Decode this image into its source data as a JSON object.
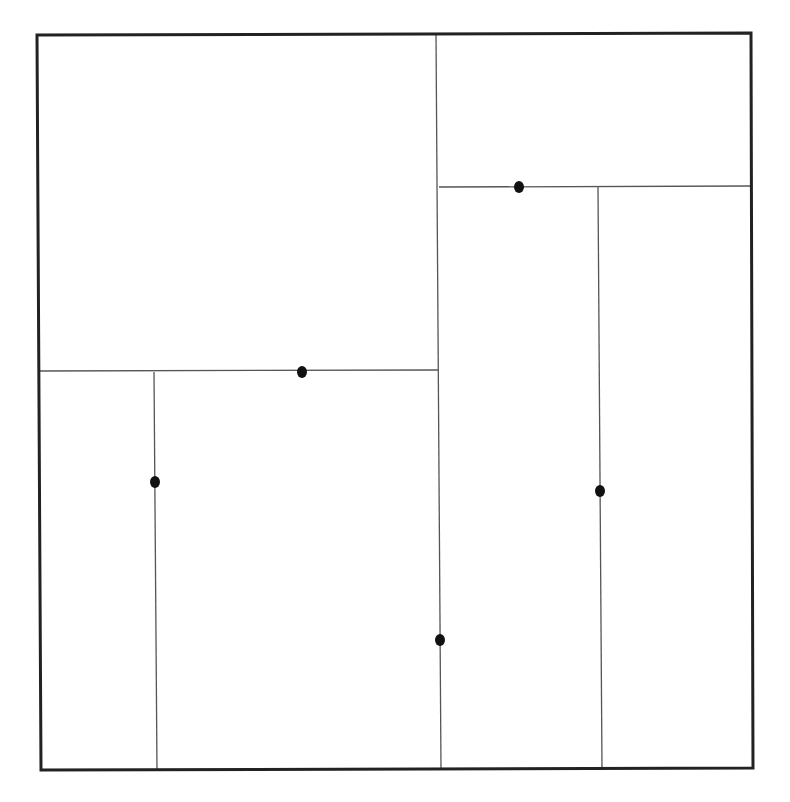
{
  "diagram": {
    "type": "kd-tree-spatial-partition",
    "background": "#ffffff",
    "border_color": "#222222",
    "line_color": "#555555",
    "point_color": "#111111",
    "bounds": {
      "x1": 37,
      "y1": 34,
      "x2": 753,
      "y2": 769
    },
    "splits": [
      {
        "id": "s1",
        "orientation": "vertical",
        "x1": 436,
        "y1": 34,
        "x2": 441,
        "y2": 769
      },
      {
        "id": "s2",
        "orientation": "horizontal",
        "x1": 39,
        "y1": 371,
        "x2": 438,
        "y2": 370
      },
      {
        "id": "s3",
        "orientation": "vertical",
        "x1": 154,
        "y1": 372,
        "x2": 157,
        "y2": 769
      },
      {
        "id": "s4",
        "orientation": "horizontal",
        "x1": 439,
        "y1": 187,
        "x2": 751,
        "y2": 186
      },
      {
        "id": "s5",
        "orientation": "vertical",
        "x1": 598,
        "y1": 187,
        "x2": 602,
        "y2": 769
      }
    ],
    "points": [
      {
        "id": "p1",
        "x": 440,
        "y": 640
      },
      {
        "id": "p2",
        "x": 302,
        "y": 372
      },
      {
        "id": "p3",
        "x": 155,
        "y": 482
      },
      {
        "id": "p4",
        "x": 519,
        "y": 187
      },
      {
        "id": "p5",
        "x": 600,
        "y": 491
      }
    ]
  }
}
